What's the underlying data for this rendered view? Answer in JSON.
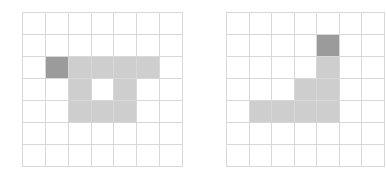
{
  "grids": [
    {
      "name": "left-grid",
      "rows": 7,
      "cols": 7,
      "dark": [
        [
          2,
          1
        ]
      ],
      "light": [
        [
          2,
          2
        ],
        [
          2,
          3
        ],
        [
          2,
          4
        ],
        [
          2,
          5
        ],
        [
          3,
          2
        ],
        [
          3,
          4
        ],
        [
          4,
          2
        ],
        [
          4,
          3
        ],
        [
          4,
          4
        ]
      ]
    },
    {
      "name": "right-grid",
      "rows": 7,
      "cols": 7,
      "dark": [
        [
          1,
          4
        ]
      ],
      "light": [
        [
          2,
          4
        ],
        [
          3,
          3
        ],
        [
          3,
          4
        ],
        [
          4,
          1
        ],
        [
          4,
          2
        ],
        [
          4,
          3
        ],
        [
          4,
          4
        ]
      ]
    }
  ],
  "colors": {
    "dark": "#9b9b9b",
    "light": "#cecece",
    "line": "#d8d8d8",
    "background": "#ffffff"
  }
}
